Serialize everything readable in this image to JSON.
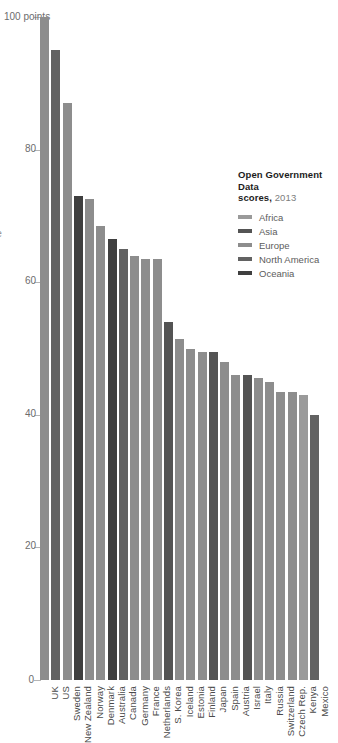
{
  "legend": {
    "title_main": "Open Government Data",
    "title_second": "scores,",
    "title_year": "2013",
    "entries": [
      {
        "label": "Africa",
        "color": "#9a9a9a"
      },
      {
        "label": "Asia",
        "color": "#545454"
      },
      {
        "label": "Europe",
        "color": "#8d8d8d"
      },
      {
        "label": "North America",
        "color": "#626262"
      },
      {
        "label": "Oceania",
        "color": "#3f3f3f"
      }
    ]
  },
  "edge_caption": "le",
  "axis": {
    "top_label": "100 points",
    "tick_labels": [
      "100 points",
      "80",
      "60",
      "40",
      "20",
      "0"
    ],
    "tick_values": [
      100,
      80,
      60,
      40,
      20,
      0
    ]
  },
  "chart_data": {
    "type": "bar",
    "title": "Open Government Data scores, 2013",
    "xlabel": "",
    "ylabel": "points",
    "ylim": [
      0,
      100
    ],
    "grid": true,
    "legend_position": "right",
    "categories": [
      "UK",
      "US",
      "Sweden",
      "New Zealand",
      "Norway",
      "Denmark",
      "Australia",
      "Canada",
      "Germany",
      "France",
      "Netherlands",
      "S. Korea",
      "Iceland",
      "Estonia",
      "Finland",
      "Japan",
      "Spain",
      "Austria",
      "Israel",
      "Italy",
      "Russia",
      "Switzerland",
      "Czech Rep.",
      "Kenya",
      "Mexico"
    ],
    "values": [
      100,
      95,
      87,
      73,
      72.5,
      68.5,
      66.5,
      65,
      64,
      63.5,
      63.5,
      54,
      51.5,
      50,
      49.5,
      49.5,
      48,
      46,
      46,
      45.5,
      45,
      43.5,
      43.5,
      43,
      40
    ],
    "groups": [
      "Europe",
      "North America",
      "Europe",
      "Oceania",
      "Europe",
      "Europe",
      "Oceania",
      "North America",
      "Europe",
      "Europe",
      "Europe",
      "Asia",
      "Europe",
      "Europe",
      "Europe",
      "Asia",
      "Europe",
      "Europe",
      "Asia",
      "Europe",
      "Europe",
      "Europe",
      "Europe",
      "Africa",
      "North America"
    ],
    "colors": [
      "#8d8d8d",
      "#626262",
      "#8d8d8d",
      "#3f3f3f",
      "#8d8d8d",
      "#8d8d8d",
      "#3f3f3f",
      "#626262",
      "#8d8d8d",
      "#8d8d8d",
      "#8d8d8d",
      "#545454",
      "#8d8d8d",
      "#8d8d8d",
      "#8d8d8d",
      "#545454",
      "#8d8d8d",
      "#8d8d8d",
      "#545454",
      "#8d8d8d",
      "#8d8d8d",
      "#8d8d8d",
      "#8d8d8d",
      "#9a9a9a",
      "#626262"
    ]
  }
}
